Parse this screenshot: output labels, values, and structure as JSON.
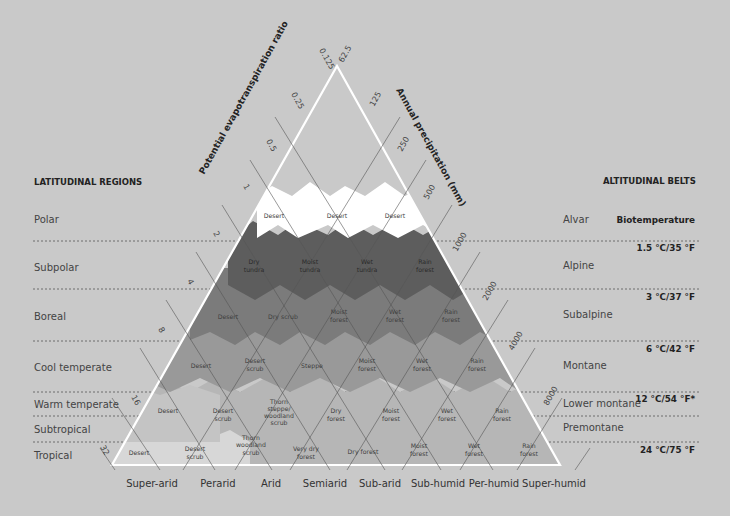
{
  "axes": {
    "left_label": "Potential evapotranspiration ratio",
    "right_label": "Annual precipitation (mm)",
    "left_ticks": [
      "0.125",
      "0.25",
      "0.5",
      "1",
      "2",
      "4",
      "8",
      "16",
      "32"
    ],
    "right_ticks": [
      "62.5",
      "125",
      "250",
      "500",
      "1000",
      "2000",
      "4000",
      "8000"
    ]
  },
  "latitudinal": {
    "heading": "LATITUDINAL REGIONS",
    "regions": [
      "Polar",
      "Subpolar",
      "Boreal",
      "Cool temperate",
      "Warm temperate",
      "Subtropical",
      "Tropical"
    ]
  },
  "altitudinal": {
    "heading": "ALTITUDINAL BELTS",
    "belts": [
      "Alvar",
      "Alpine",
      "Subalpine",
      "Montane",
      "Lower montane",
      "Premontane"
    ],
    "biotemperature_heading": "Biotemperature",
    "temperatures": [
      "1.5 °C/35 °F",
      "3 °C/37 °F",
      "6 °C/42 °F",
      "12 °C/54 °F*",
      "24 °C/75 °F"
    ]
  },
  "humidity_provinces": [
    "Super-arid",
    "Perarid",
    "Arid",
    "Semiarid",
    "Sub-arid",
    "Sub-humid",
    "Per-humid",
    "Super-humid"
  ],
  "zones": {
    "polar": [
      "Desert",
      "Desert",
      "Desert"
    ],
    "subpolar": [
      [
        "Dry",
        "tundra"
      ],
      [
        "Moist",
        "tundra"
      ],
      [
        "Wet",
        "tundra"
      ],
      [
        "Rain",
        "forest"
      ]
    ],
    "boreal": [
      [
        "Desert"
      ],
      [
        "Dry scrub"
      ],
      [
        "Moist",
        "forest"
      ],
      [
        "Wet",
        "forest"
      ],
      [
        "Rain",
        "forest"
      ]
    ],
    "cool_temperate": [
      [
        "Desert"
      ],
      [
        "Desert",
        "scrub"
      ],
      [
        "Steppe"
      ],
      [
        "Moist",
        "forest"
      ],
      [
        "Wet",
        "forest"
      ],
      [
        "Rain",
        "forest"
      ]
    ],
    "warm_temperate": [
      [
        "Desert"
      ],
      [
        "Desert",
        "scrub"
      ],
      [
        "Thorn",
        "steppe/",
        "woodland",
        "scrub"
      ],
      [
        "Dry",
        "forest"
      ],
      [
        "Moist",
        "forest"
      ],
      [
        "Wet",
        "forest"
      ],
      [
        "Rain",
        "forest"
      ]
    ],
    "tropical": [
      [
        "Desert"
      ],
      [
        "Desert",
        "scrub"
      ],
      [
        "Thorn",
        "woodland",
        "scrub"
      ],
      [
        "Very dry",
        "forest"
      ],
      [
        "Dry forest"
      ],
      [
        "Moist",
        "forest"
      ],
      [
        "Wet",
        "forest"
      ],
      [
        "Rain",
        "forest"
      ]
    ]
  },
  "colors": {
    "background": "#c9c9c9",
    "polar": "#ffffff",
    "subpolar": "#5e5e5e",
    "boreal": "#7c7c7c",
    "cool_temperate": "#9a9a9a",
    "warm_temperate": "#adadad",
    "tropical": "#bdbdbd",
    "frame": "#ffffff"
  }
}
